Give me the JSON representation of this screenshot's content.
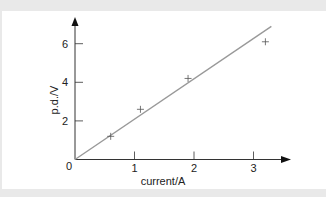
{
  "chart_data": {
    "type": "scatter",
    "title": "",
    "xlabel": "current/A",
    "ylabel": "p.d./V",
    "xlim": [
      0,
      3.6
    ],
    "ylim": [
      0,
      7
    ],
    "x_ticks": [
      1,
      2,
      3
    ],
    "y_ticks": [
      2,
      4,
      6
    ],
    "origin_label": "0",
    "grid": false,
    "legend": null,
    "series": [
      {
        "name": "measurements",
        "marker": "+",
        "points": [
          {
            "x": 0.6,
            "y": 1.2
          },
          {
            "x": 1.1,
            "y": 2.6
          },
          {
            "x": 1.9,
            "y": 4.2
          },
          {
            "x": 3.2,
            "y": 6.1
          }
        ]
      },
      {
        "name": "best-fit line",
        "type": "line",
        "points": [
          {
            "x": 0,
            "y": 0
          },
          {
            "x": 3.3,
            "y": 6.9
          }
        ]
      }
    ],
    "colors": {
      "axes": "#333333",
      "line": "#999999",
      "markers": "#555555",
      "panel": "#ffffff",
      "background": "#e9e9e9"
    }
  }
}
